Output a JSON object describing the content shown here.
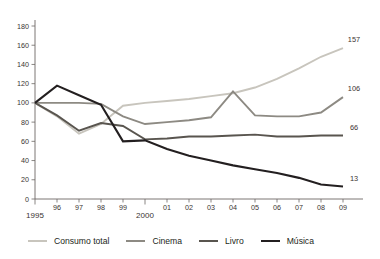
{
  "chart_data": {
    "type": "line",
    "title": "",
    "subtitle": "",
    "xlabel": "",
    "ylabel": "",
    "grid": false,
    "legend_position": "bottom",
    "x": [
      1995,
      1996,
      1997,
      1998,
      1999,
      2000,
      2001,
      2002,
      2003,
      2004,
      2005,
      2006,
      2007,
      2008,
      2009
    ],
    "categories": [
      "1995",
      "96",
      "97",
      "98",
      "99",
      "2000",
      "01",
      "02",
      "03",
      "04",
      "05",
      "06",
      "07",
      "08",
      "09"
    ],
    "xtick_labels": [
      "1995",
      "96",
      "97",
      "98",
      "99",
      "2000",
      "01",
      "02",
      "03",
      "04",
      "05",
      "06",
      "07",
      "08",
      "09"
    ],
    "xtick_major": [
      "1995",
      "2000",
      "2005"
    ],
    "ytick_labels": [
      "0",
      "20",
      "40",
      "60",
      "80",
      "100",
      "120",
      "140",
      "160",
      "180"
    ],
    "ylim": [
      0,
      180
    ],
    "ystep": 20,
    "xlim": [
      1995,
      2009
    ],
    "series": [
      {
        "name": "Consumo total",
        "color": "#c8c5bd",
        "width": 1.9,
        "end_label": "157",
        "values": [
          100,
          86,
          68,
          78,
          97,
          100,
          102,
          104,
          107,
          110,
          116,
          125,
          136,
          148,
          157
        ]
      },
      {
        "name": "Cinema",
        "color": "#8d8a83",
        "width": 1.9,
        "end_label": "106",
        "values": [
          100,
          100,
          100,
          99,
          86,
          78,
          80,
          82,
          85,
          112,
          87,
          86,
          86,
          90,
          106
        ]
      },
      {
        "name": "Livro",
        "color": "#59554f",
        "width": 1.9,
        "end_label": "66",
        "values": [
          100,
          87,
          71,
          79,
          76,
          62,
          63,
          65,
          65,
          66,
          67,
          65,
          65,
          66,
          66
        ]
      },
      {
        "name": "Música",
        "color": "#231f20",
        "width": 2.1,
        "end_label": "13",
        "values": [
          100,
          118,
          108,
          98,
          60,
          61,
          52,
          45,
          40,
          35,
          31,
          27,
          22,
          15,
          13
        ]
      }
    ]
  },
  "legend": {
    "items": [
      {
        "label": "Consumo total",
        "color": "#c8c5bd"
      },
      {
        "label": "Cinema",
        "color": "#8d8a83"
      },
      {
        "label": "Livro",
        "color": "#59554f"
      },
      {
        "label": "Música",
        "color": "#231f20"
      }
    ]
  }
}
